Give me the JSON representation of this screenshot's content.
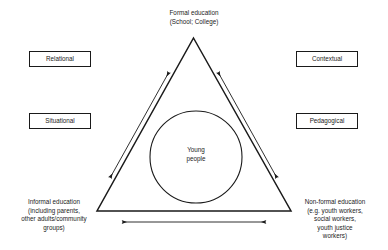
{
  "diagram": {
    "apex_label": "Formal education\n(School; College)",
    "bottom_left_label": "Informal education\n(including parents,\nother adults/community\ngroups)",
    "bottom_right_label": "Non-formal education\n(e.g. youth workers,\nsocial workers,\nyouth justice\nworkers)",
    "center_label": "Young\npeople",
    "side_boxes": [
      {
        "id": "relational",
        "label": "Relational"
      },
      {
        "id": "situational",
        "label": "Situational"
      },
      {
        "id": "contextual",
        "label": "Contextual"
      },
      {
        "id": "pedagogical",
        "label": "Pedagogical"
      }
    ],
    "arrows": [
      {
        "id": "left-edge-arrow",
        "direction": "double",
        "orientation": "diagonal-up-right"
      },
      {
        "id": "right-edge-arrow",
        "direction": "double",
        "orientation": "diagonal-down-right"
      },
      {
        "id": "base-arrow",
        "direction": "double",
        "orientation": "horizontal"
      }
    ],
    "colors": {
      "stroke": "#1a1a1a",
      "background": "#ffffff",
      "text": "#1a1a1a"
    }
  }
}
